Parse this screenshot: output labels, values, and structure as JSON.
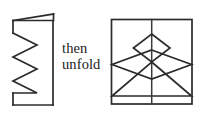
{
  "figure": {
    "type": "paper-folding-diagram",
    "background_color": "#ffffff",
    "stroke_color": "#2b2b2b",
    "caption": {
      "line1": "then",
      "line2": "unfold",
      "full_text": "then\nunfold"
    },
    "left_panel": {
      "name": "folded-paper-with-zigzag-cut",
      "description": "Folded sheet seen edge-on with a peeled-back top flap and a zigzag cut line",
      "rect": {
        "x": 13,
        "y": 20,
        "width": 40,
        "height": 85
      },
      "flap_slant": {
        "x1": 13,
        "y1": 20,
        "x2": 53,
        "y2": 14
      },
      "flap_right_edge": {
        "x1": 53,
        "y1": 14,
        "x2": 53,
        "y2": 20
      },
      "zigzag_points": "13,33 37,45 13,57 37,69 13,81 37,93 13,93",
      "zigzag_peak_x": 37,
      "zigzag_valley_x": 13
    },
    "right_panel": {
      "name": "unfolded-paper-with-tree-shape",
      "description": "Unfolded square sheet showing a symmetric tree figure: small diamond, large diamond and triangle, bisected by a vertical fold line",
      "rect": {
        "x": 111,
        "y": 19,
        "width": 81,
        "height": 85
      },
      "fold_line": {
        "x": 151.5,
        "y1": 19,
        "y2": 104
      },
      "small_diamond": "151.5,34 170,48 151.5,62 133,48",
      "large_diamond": "151.5,50 192,64.5 151.5,79 111,64.5",
      "triangle": "151.5,62 192,96 111,96"
    }
  }
}
